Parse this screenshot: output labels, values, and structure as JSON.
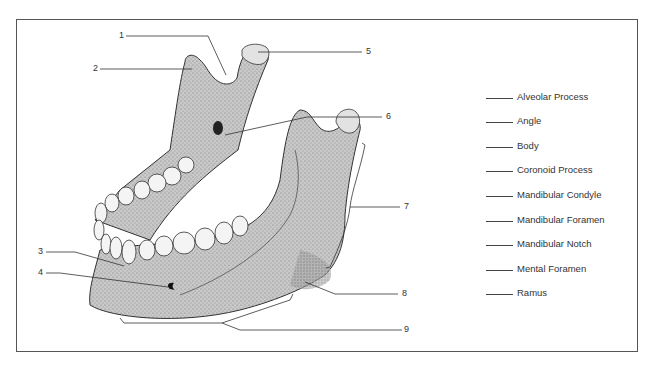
{
  "figure": {
    "numbers": [
      "1",
      "2",
      "3",
      "4",
      "5",
      "6",
      "7",
      "8",
      "9"
    ],
    "legend": [
      {
        "blank": "______",
        "label": "Alveolar Process"
      },
      {
        "blank": "______",
        "label": "Angle"
      },
      {
        "blank": "______",
        "label": "Body"
      },
      {
        "blank": "______",
        "label": "Coronoid Process"
      },
      {
        "blank": "______",
        "label": "Mandibular Condyle"
      },
      {
        "blank": "______",
        "label": "Mandibular Foramen"
      },
      {
        "blank": "______",
        "label": "Mandibular Notch"
      },
      {
        "blank": "______",
        "label": "Mental Foramen"
      },
      {
        "blank": "______",
        "label": "Ramus"
      }
    ]
  }
}
